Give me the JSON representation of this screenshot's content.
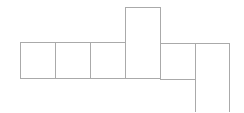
{
  "diagram": {
    "type": "cube-net-style grid of squares",
    "stroke_color": "#aaaaaa",
    "stroke_width": 1,
    "background": "#ffffff",
    "cells": [
      {
        "id": "cell-1",
        "x": 20,
        "y": 42,
        "w": 35,
        "h": 36
      },
      {
        "id": "cell-2",
        "x": 55,
        "y": 42,
        "w": 35,
        "h": 36
      },
      {
        "id": "cell-3",
        "x": 90,
        "y": 42,
        "w": 35,
        "h": 36
      },
      {
        "id": "cell-4-tall",
        "x": 125,
        "y": 7,
        "w": 35,
        "h": 71
      },
      {
        "id": "cell-5",
        "x": 160,
        "y": 43,
        "w": 35,
        "h": 36
      },
      {
        "id": "cell-6-tall",
        "x": 195,
        "y": 43,
        "w": 34,
        "h": 72
      }
    ]
  }
}
